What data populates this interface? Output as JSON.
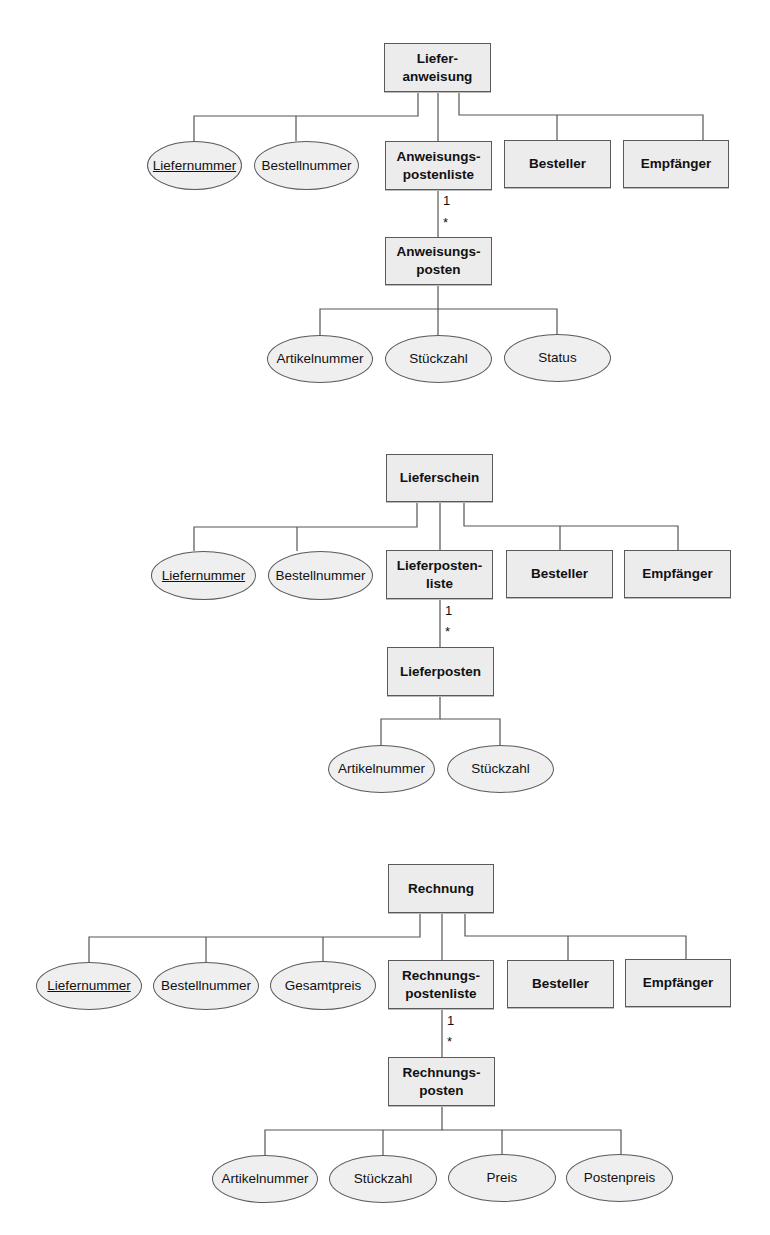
{
  "diagrams": [
    {
      "name": "lieferanweisung",
      "nodes": [
        {
          "id": "root",
          "type": "entity",
          "label": "Liefer-\nanweisung",
          "x": 384,
          "y": 43,
          "w": 107,
          "h": 49
        },
        {
          "id": "a1",
          "type": "attribute",
          "key": true,
          "label": "Liefernummer",
          "x": 147,
          "y": 141,
          "w": 95,
          "h": 49
        },
        {
          "id": "a2",
          "type": "attribute",
          "label": "Bestellnummer",
          "x": 254,
          "y": 141,
          "w": 105,
          "h": 49
        },
        {
          "id": "list",
          "type": "entity",
          "label": "Anweisungs-\npostenliste",
          "x": 385,
          "y": 141,
          "w": 107,
          "h": 49
        },
        {
          "id": "e1",
          "type": "entity",
          "label": "Besteller",
          "x": 504,
          "y": 140,
          "w": 107,
          "h": 48
        },
        {
          "id": "e2",
          "type": "entity",
          "label": "Empfänger",
          "x": 623,
          "y": 140,
          "w": 106,
          "h": 48
        },
        {
          "id": "item",
          "type": "entity",
          "label": "Anweisungs-\nposten",
          "x": 385,
          "y": 237,
          "w": 107,
          "h": 48
        },
        {
          "id": "b1",
          "type": "attribute",
          "label": "Artikelnummer",
          "x": 267,
          "y": 335,
          "w": 106,
          "h": 48
        },
        {
          "id": "b2",
          "type": "attribute",
          "label": "Stückzahl",
          "x": 385,
          "y": 335,
          "w": 107,
          "h": 48
        },
        {
          "id": "b3",
          "type": "attribute",
          "label": "Status",
          "x": 504,
          "y": 334,
          "w": 107,
          "h": 48
        }
      ],
      "lines": [
        [
          [
            418,
            92
          ],
          [
            418,
            116
          ],
          [
            194,
            116
          ],
          [
            194,
            141
          ]
        ],
        [
          [
            296,
            116
          ],
          [
            296,
            141
          ]
        ],
        [
          [
            438,
            92
          ],
          [
            438,
            141
          ]
        ],
        [
          [
            459,
            92
          ],
          [
            459,
            115
          ],
          [
            703,
            115
          ],
          [
            703,
            140
          ]
        ],
        [
          [
            557,
            115
          ],
          [
            557,
            140
          ]
        ],
        [
          [
            438,
            190
          ],
          [
            438,
            237
          ]
        ],
        [
          [
            438,
            285
          ],
          [
            438,
            309
          ],
          [
            320,
            309
          ],
          [
            320,
            335
          ]
        ],
        [
          [
            438,
            309
          ],
          [
            557,
            309
          ],
          [
            557,
            334
          ]
        ],
        [
          [
            438,
            309
          ],
          [
            438,
            335
          ]
        ]
      ],
      "multiplicity": [
        {
          "label": "1",
          "x": 443,
          "y": 193
        },
        {
          "label": "*",
          "x": 443,
          "y": 215
        }
      ]
    },
    {
      "name": "lieferschein",
      "nodes": [
        {
          "id": "root",
          "type": "entity",
          "label": "Lieferschein",
          "x": 386,
          "y": 454,
          "w": 107,
          "h": 48
        },
        {
          "id": "a1",
          "type": "attribute",
          "key": true,
          "label": "Liefernummer",
          "x": 151,
          "y": 551,
          "w": 105,
          "h": 49
        },
        {
          "id": "a2",
          "type": "attribute",
          "label": "Bestellnummer",
          "x": 268,
          "y": 551,
          "w": 105,
          "h": 49
        },
        {
          "id": "list",
          "type": "entity",
          "label": "Lieferposten-\nliste",
          "x": 386,
          "y": 550,
          "w": 107,
          "h": 49
        },
        {
          "id": "e1",
          "type": "entity",
          "label": "Besteller",
          "x": 506,
          "y": 550,
          "w": 107,
          "h": 48
        },
        {
          "id": "e2",
          "type": "entity",
          "label": "Empfänger",
          "x": 624,
          "y": 550,
          "w": 107,
          "h": 48
        },
        {
          "id": "item",
          "type": "entity",
          "label": "Lieferposten",
          "x": 387,
          "y": 647,
          "w": 107,
          "h": 49
        },
        {
          "id": "b1",
          "type": "attribute",
          "label": "Artikelnummer",
          "x": 328,
          "y": 745,
          "w": 107,
          "h": 48
        },
        {
          "id": "b2",
          "type": "attribute",
          "label": "Stückzahl",
          "x": 447,
          "y": 745,
          "w": 107,
          "h": 48
        }
      ],
      "lines": [
        [
          [
            417,
            502
          ],
          [
            417,
            527
          ],
          [
            194,
            527
          ],
          [
            194,
            551
          ]
        ],
        [
          [
            297,
            527
          ],
          [
            297,
            551
          ]
        ],
        [
          [
            440,
            502
          ],
          [
            440,
            550
          ]
        ],
        [
          [
            464,
            502
          ],
          [
            464,
            526
          ],
          [
            678,
            526
          ],
          [
            678,
            550
          ]
        ],
        [
          [
            560,
            526
          ],
          [
            560,
            550
          ]
        ],
        [
          [
            440,
            599
          ],
          [
            440,
            647
          ]
        ],
        [
          [
            440,
            696
          ],
          [
            440,
            719
          ],
          [
            381,
            719
          ],
          [
            381,
            745
          ]
        ],
        [
          [
            440,
            719
          ],
          [
            500,
            719
          ],
          [
            500,
            745
          ]
        ]
      ],
      "multiplicity": [
        {
          "label": "1",
          "x": 445,
          "y": 603
        },
        {
          "label": "*",
          "x": 445,
          "y": 624
        }
      ]
    },
    {
      "name": "rechnung",
      "nodes": [
        {
          "id": "root",
          "type": "entity",
          "label": "Rechnung",
          "x": 388,
          "y": 864,
          "w": 106,
          "h": 49
        },
        {
          "id": "a1",
          "type": "attribute",
          "key": true,
          "label": "Liefernummer",
          "x": 36,
          "y": 962,
          "w": 106,
          "h": 48
        },
        {
          "id": "a2",
          "type": "attribute",
          "label": "Bestellnummer",
          "x": 153,
          "y": 962,
          "w": 106,
          "h": 48
        },
        {
          "id": "a3",
          "type": "attribute",
          "label": "Gesamtpreis",
          "x": 270,
          "y": 961,
          "w": 106,
          "h": 49
        },
        {
          "id": "list",
          "type": "entity",
          "label": "Rechnungs-\npostenliste",
          "x": 388,
          "y": 960,
          "w": 106,
          "h": 49
        },
        {
          "id": "e1",
          "type": "entity",
          "label": "Besteller",
          "x": 507,
          "y": 960,
          "w": 107,
          "h": 48
        },
        {
          "id": "e2",
          "type": "entity",
          "label": "Empfänger",
          "x": 625,
          "y": 959,
          "w": 106,
          "h": 48
        },
        {
          "id": "item",
          "type": "entity",
          "label": "Rechnungs-\nposten",
          "x": 388,
          "y": 1057,
          "w": 107,
          "h": 49
        },
        {
          "id": "b1",
          "type": "attribute",
          "label": "Artikelnummer",
          "x": 212,
          "y": 1155,
          "w": 106,
          "h": 48
        },
        {
          "id": "b2",
          "type": "attribute",
          "label": "Stückzahl",
          "x": 329,
          "y": 1155,
          "w": 108,
          "h": 48
        },
        {
          "id": "b3",
          "type": "attribute",
          "label": "Preis",
          "x": 448,
          "y": 1154,
          "w": 108,
          "h": 48
        },
        {
          "id": "b4",
          "type": "attribute",
          "label": "Postenpreis",
          "x": 566,
          "y": 1154,
          "w": 107,
          "h": 48
        }
      ],
      "lines": [
        [
          [
            420,
            913
          ],
          [
            420,
            937
          ],
          [
            89,
            937
          ],
          [
            89,
            962
          ]
        ],
        [
          [
            206,
            937
          ],
          [
            206,
            962
          ]
        ],
        [
          [
            323,
            937
          ],
          [
            323,
            961
          ]
        ],
        [
          [
            442,
            913
          ],
          [
            442,
            960
          ]
        ],
        [
          [
            465,
            913
          ],
          [
            465,
            936
          ],
          [
            686,
            936
          ],
          [
            686,
            959
          ]
        ],
        [
          [
            568,
            936
          ],
          [
            568,
            960
          ]
        ],
        [
          [
            442,
            1009
          ],
          [
            442,
            1057
          ]
        ],
        [
          [
            442,
            1106
          ],
          [
            442,
            1130
          ],
          [
            265,
            1130
          ],
          [
            265,
            1155
          ]
        ],
        [
          [
            442,
            1130
          ],
          [
            621,
            1130
          ],
          [
            621,
            1154
          ]
        ],
        [
          [
            383,
            1130
          ],
          [
            383,
            1155
          ]
        ],
        [
          [
            502,
            1130
          ],
          [
            502,
            1154
          ]
        ]
      ],
      "multiplicity": [
        {
          "label": "1",
          "x": 447,
          "y": 1013
        },
        {
          "label": "*",
          "x": 447,
          "y": 1034
        }
      ]
    }
  ],
  "colors": {
    "line": "#555555",
    "entity_fill": "#ececec",
    "attribute_fill": "#efefef",
    "text": "#111111"
  }
}
